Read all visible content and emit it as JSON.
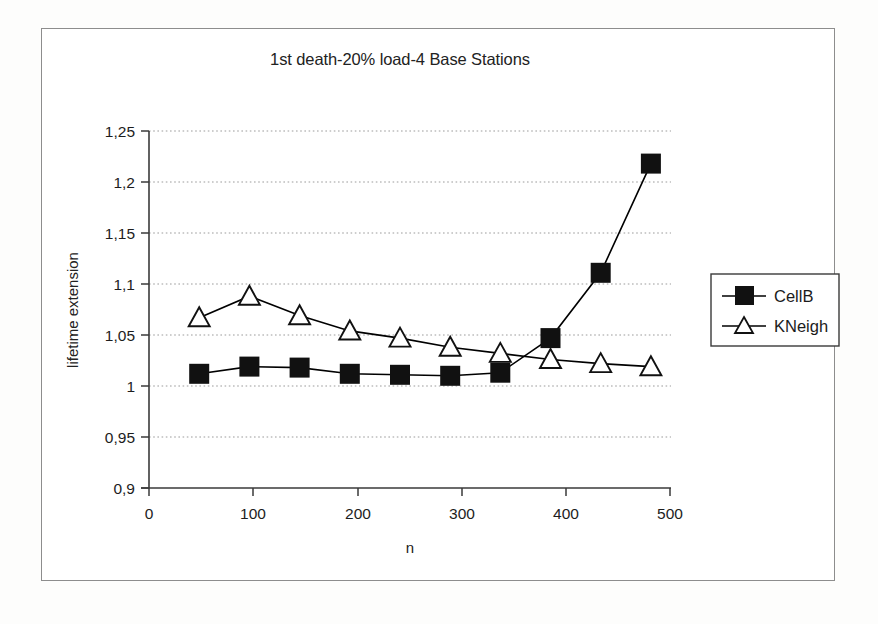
{
  "figure": {
    "title": "1st death-20% load-4 Base Stations",
    "frame_color": "#8d8d8d",
    "background": "#ffffff"
  },
  "chart_data": {
    "type": "line",
    "title": "1st death-20% load-4 Base Stations",
    "xlabel": "n",
    "ylabel": "lifetime extension",
    "x": [
      50,
      100,
      150,
      200,
      250,
      300,
      350,
      400,
      450,
      500
    ],
    "xlim": [
      0,
      520
    ],
    "ylim": [
      0.9,
      1.25
    ],
    "xticks": [
      0,
      100,
      200,
      300,
      400,
      500
    ],
    "xticklabels": [
      "0",
      "100",
      "200",
      "300",
      "400",
      "500"
    ],
    "yticks": [
      0.9,
      0.95,
      1.0,
      1.05,
      1.1,
      1.15,
      1.2,
      1.25
    ],
    "yticklabels": [
      "0,9",
      "0,95",
      "1",
      "1,05",
      "1,1",
      "1,15",
      "1,2",
      "1,25"
    ],
    "grid": "horizontal-dotted",
    "legend_position": "right-outside",
    "series": [
      {
        "name": "CellB",
        "marker": "filled-square",
        "color": "#000000",
        "values": [
          1.012,
          1.019,
          1.018,
          1.012,
          1.011,
          1.01,
          1.013,
          1.047,
          1.111,
          1.218
        ]
      },
      {
        "name": "KNeigh",
        "marker": "open-triangle",
        "color": "#000000",
        "values": [
          1.067,
          1.088,
          1.069,
          1.054,
          1.047,
          1.038,
          1.032,
          1.026,
          1.022,
          1.019
        ]
      }
    ]
  },
  "legend": {
    "entries": [
      {
        "label": "CellB",
        "marker": "filled-square-marker"
      },
      {
        "label": "KNeigh",
        "marker": "open-triangle-marker"
      }
    ]
  }
}
